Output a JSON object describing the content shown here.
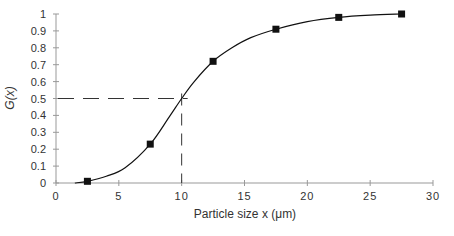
{
  "chart_data": {
    "type": "line",
    "title": "",
    "xlabel": "Particle size x (μm)",
    "ylabel": "G(x)",
    "xlim": [
      0,
      30
    ],
    "ylim": [
      0,
      1
    ],
    "x_ticks": [
      0,
      5,
      10,
      15,
      20,
      25,
      30
    ],
    "x_tick_labels": [
      "0",
      "5",
      "10",
      "15",
      "20",
      "25",
      "30"
    ],
    "y_ticks": [
      0,
      0.1,
      0.2,
      0.3,
      0.4,
      0.5,
      0.6,
      0.7,
      0.8,
      0.9,
      1
    ],
    "y_tick_labels": [
      "0",
      "0.1",
      "0.2",
      "0.3",
      "0.4",
      "0.5",
      "0.6",
      "0.7",
      "0.8",
      "0.9",
      "1"
    ],
    "grid": false,
    "legend": null,
    "series": [
      {
        "name": "G(x) data points",
        "marker": "square",
        "x": [
          2.5,
          7.5,
          12.5,
          17.5,
          22.5,
          27.5
        ],
        "y": [
          0.01,
          0.23,
          0.72,
          0.91,
          0.98,
          1.0
        ]
      },
      {
        "name": "G(x) smooth curve",
        "marker": "none",
        "x": [
          1.5,
          2.5,
          4,
          5.5,
          7.5,
          9,
          10,
          11,
          12.5,
          14,
          15.5,
          17.5,
          20,
          22.5,
          25,
          27.5
        ],
        "y": [
          0.0,
          0.01,
          0.04,
          0.09,
          0.23,
          0.39,
          0.5,
          0.6,
          0.72,
          0.8,
          0.86,
          0.91,
          0.955,
          0.98,
          0.993,
          1.0
        ]
      }
    ],
    "annotations": [
      {
        "type": "dashed-hline",
        "y": 0.5,
        "x_from": 0,
        "x_to": 10
      },
      {
        "type": "dashed-vline",
        "x": 10,
        "y_from": 0,
        "y_to": 0.5
      }
    ],
    "colors": {
      "axis": "#999999",
      "line": "#111111",
      "marker": "#111111",
      "text": "#333333"
    }
  }
}
